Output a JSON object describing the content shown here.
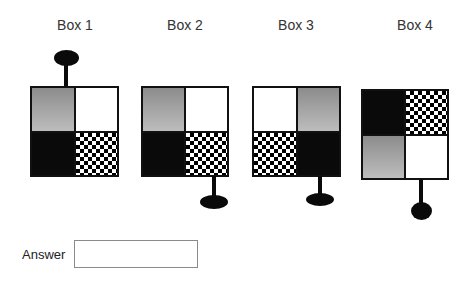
{
  "puzzle": {
    "boxes": [
      {
        "label": "Box 1",
        "quadrants": [
          "gray",
          "white",
          "black",
          "checker"
        ],
        "pin": "top"
      },
      {
        "label": "Box 2",
        "quadrants": [
          "gray",
          "white",
          "black",
          "checker"
        ],
        "pin": "bottom-right"
      },
      {
        "label": "Box 3",
        "quadrants": [
          "white",
          "gray",
          "checker",
          "black"
        ],
        "pin": "bottom-right"
      },
      {
        "label": "Box 4",
        "quadrants": [
          "black",
          "checker",
          "gray",
          "white"
        ],
        "pin": "bottom-right"
      }
    ]
  },
  "answer": {
    "label": "Answer",
    "value": "",
    "placeholder": ""
  },
  "colors": {
    "black": "#0a0a0a",
    "white": "#ffffff",
    "gray_top": "#8c8c8c",
    "gray_bottom": "#bdbdbd",
    "text": "#333333"
  }
}
